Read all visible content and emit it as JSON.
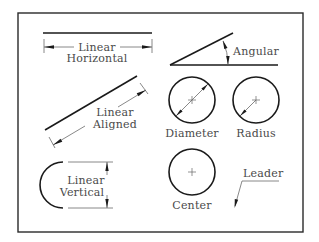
{
  "diagram": {
    "type": "dimension-types-reference",
    "labels": {
      "linear_horizontal": {
        "line1": "Linear",
        "line2": "Horizontal"
      },
      "linear_aligned": {
        "line1": "Linear",
        "line2": "Aligned"
      },
      "linear_vertical": {
        "line1": "Linear",
        "line2": "Vertical"
      },
      "angular": "Angular",
      "diameter": "Diameter",
      "radius": "Radius",
      "center": "Center",
      "leader": "Leader"
    },
    "colors": {
      "object_line": "#1a1a1a",
      "dimension_line": "#6a6a6a",
      "text": "#4a4a4a",
      "background": "#ffffff"
    }
  }
}
